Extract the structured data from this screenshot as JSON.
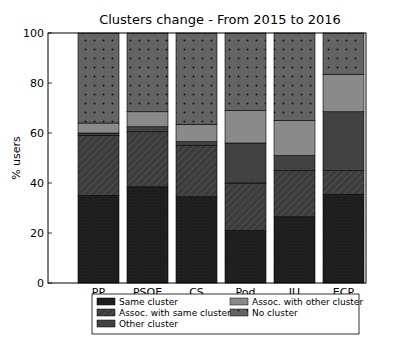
{
  "chart_data": {
    "type": "bar",
    "stacked": true,
    "title": "Clusters change - From 2015 to 2016",
    "xlabel": "",
    "ylabel": "% users",
    "ylim": [
      0,
      100
    ],
    "yticks": [
      0,
      20,
      40,
      60,
      80,
      100
    ],
    "grid": false,
    "legend_position": "below",
    "categories": [
      "PP",
      "PSOE",
      "CS",
      "Pod",
      "IU",
      "ECP"
    ],
    "series": [
      {
        "name": "Same cluster",
        "values": [
          35,
          38.5,
          34.5,
          21,
          26.5,
          35.5
        ],
        "color": "#1e1e1e",
        "pattern": "dense"
      },
      {
        "name": "Assoc. with same cluster",
        "values": [
          24,
          22,
          20.5,
          19,
          18.5,
          9.5
        ],
        "color": "#3c3c3c",
        "pattern": "hatch"
      },
      {
        "name": "Other cluster",
        "values": [
          1,
          2,
          1.5,
          16,
          6,
          23.5
        ],
        "color": "#424242",
        "pattern": "solid"
      },
      {
        "name": "Assoc. with other cluster",
        "values": [
          4,
          6,
          7,
          13,
          14,
          15
        ],
        "color": "#8a8a8a",
        "pattern": "solid"
      },
      {
        "name": "No cluster",
        "values": [
          36,
          31.5,
          36.5,
          31,
          35,
          16.5
        ],
        "color": "#646464",
        "pattern": "dots"
      }
    ]
  },
  "legend": {
    "items": [
      {
        "label": "Same cluster"
      },
      {
        "label": "Assoc. with other cluster"
      },
      {
        "label": "Assoc. with same cluster"
      },
      {
        "label": "No cluster"
      },
      {
        "label": "Other cluster"
      }
    ]
  }
}
